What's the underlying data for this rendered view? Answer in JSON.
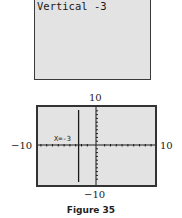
{
  "home_screen": {
    "text": "Vertical -3"
  },
  "graph_screen": {
    "window": {
      "ymax_label": "10",
      "ymin_label": "−10",
      "xmin_label": "−10",
      "xmax_label": "10"
    },
    "curve_label": "X=-3",
    "vertical_line_x": -3
  },
  "caption": "Figure 35",
  "colors": {
    "screen_bg": "#e3e3e3",
    "border": "#333333",
    "line": "#1a1a1a"
  }
}
